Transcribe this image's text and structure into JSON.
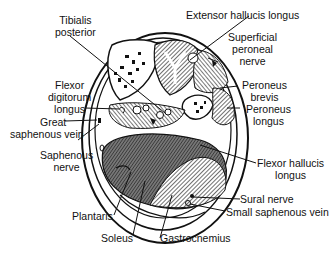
{
  "diagram": {
    "labels": {
      "tibialis_posterior": [
        "Tibialis",
        "posterior"
      ],
      "extensor_hallucis_longus": [
        "Extensor  hallucis longus"
      ],
      "superficial_peroneal_nerve": [
        "Superficial",
        "peroneal",
        "nerve"
      ],
      "flexor_digitorum_longus": [
        "Flexor",
        "digitorum",
        "longus"
      ],
      "peroneus_brevis": [
        "Peroneus",
        "brevis"
      ],
      "peroneus_longus": [
        "Peroneus",
        "longus"
      ],
      "great_saphenous_vein": [
        "Great",
        "saphenous vein"
      ],
      "saphenous_nerve": [
        "Saphenous",
        "nerve"
      ],
      "flexor_hallucis_longus": [
        "Flexor hallucis",
        "longus"
      ],
      "sural_nerve": [
        "Sural nerve"
      ],
      "small_saphenous_vein": [
        "Small saphenous vein"
      ],
      "plantaris": [
        "Plantaris"
      ],
      "soleus": [
        "Soleus"
      ],
      "gastrocnemius": [
        "Gastrocnemius"
      ]
    }
  }
}
